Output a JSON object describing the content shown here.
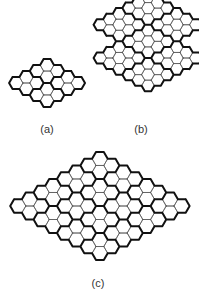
{
  "figures": [
    {
      "id": "a",
      "label": "(a)",
      "label_pos": [
        47,
        123
      ],
      "hex_size": 6.9,
      "origin": [
        16,
        83
      ],
      "shape": "rhombus",
      "n": 4,
      "block": 2
    },
    {
      "id": "b",
      "label": "(b)",
      "label_pos": [
        141,
        123
      ],
      "hex_size": 6.4,
      "origin": [
        100,
        58
      ],
      "shape": "composite",
      "blocks": [
        {
          "q0": 0,
          "r0": 0,
          "n": 3
        },
        {
          "q0": 3,
          "r0": -3,
          "n": 3
        },
        {
          "q0": 6,
          "r0": -3,
          "n": 3
        },
        {
          "q0": 3,
          "r0": 0,
          "n": 3
        },
        {
          "q0": 0,
          "r0": 3,
          "n": 3
        },
        {
          "q0": 3,
          "r0": 3,
          "n": 3
        },
        {
          "q0": 6,
          "r0": 0,
          "n": 3
        }
      ]
    },
    {
      "id": "c",
      "label": "(c)",
      "label_pos": [
        98,
        277
      ],
      "hex_size": 7.8,
      "origin": [
        18,
        206
      ],
      "shape": "rhombus",
      "n": 8,
      "block": 2
    }
  ],
  "style": {
    "thin": "#555555",
    "thick": "#111111",
    "thin_w": 0.7,
    "thick_w": 2
  }
}
